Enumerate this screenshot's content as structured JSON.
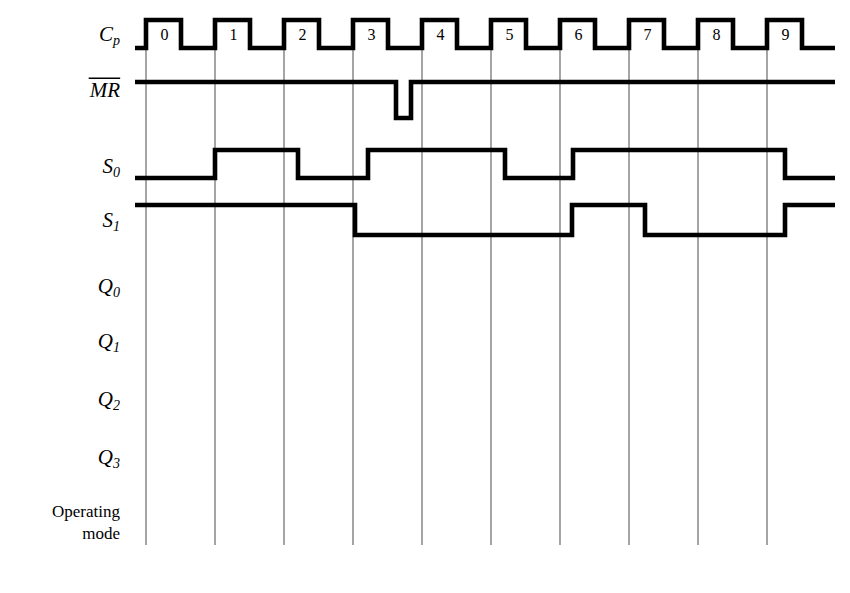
{
  "diagram": {
    "background_color": "#ffffff",
    "line_color": "#000000",
    "grid_color": "#5a5a5a"
  },
  "signals": [
    {
      "id": "cp",
      "label": "C",
      "subscript": "p",
      "overline": false,
      "style": "italic"
    },
    {
      "id": "mr",
      "label": "MR",
      "subscript": "",
      "overline": true,
      "style": "italic"
    },
    {
      "id": "s0",
      "label": "S",
      "subscript": "0",
      "overline": false,
      "style": "italic"
    },
    {
      "id": "s1",
      "label": "S",
      "subscript": "1",
      "overline": false,
      "style": "italic"
    },
    {
      "id": "q0",
      "label": "Q",
      "subscript": "0",
      "overline": false,
      "style": "italic"
    },
    {
      "id": "q1",
      "label": "Q",
      "subscript": "1",
      "overline": false,
      "style": "italic"
    },
    {
      "id": "q2",
      "label": "Q",
      "subscript": "2",
      "overline": false,
      "style": "italic"
    },
    {
      "id": "q3",
      "label": "Q",
      "subscript": "3",
      "overline": false,
      "style": "italic"
    }
  ],
  "bottom_label": {
    "line1": "Operating",
    "line2": "mode"
  },
  "clock": {
    "cycle_labels": [
      "0",
      "1",
      "2",
      "3",
      "4",
      "5",
      "6",
      "7",
      "8",
      "9"
    ],
    "pulse_count": 10
  },
  "chart_data": {
    "type": "line",
    "xlabel": "",
    "ylabel": "",
    "grid": true,
    "x_axis": {
      "unit": "clock cycle",
      "gridline_positions_px": [
        146,
        215,
        284,
        353,
        422,
        491,
        560,
        629,
        698,
        767
      ],
      "plot_left_px": 135,
      "plot_right_px": 835,
      "cycle_width_px": 69
    },
    "series": [
      {
        "name": "Cp",
        "description": "Free running clock, ten pulses numbered 0 through 9",
        "levels": [
          "low",
          "high"
        ],
        "high_y_px": 20,
        "low_y_px": 48,
        "pulses": [
          {
            "label": "0",
            "rise_px": 146,
            "fall_px": 181
          },
          {
            "label": "1",
            "rise_px": 215,
            "fall_px": 250
          },
          {
            "label": "2",
            "rise_px": 284,
            "fall_px": 319
          },
          {
            "label": "3",
            "rise_px": 353,
            "fall_px": 388
          },
          {
            "label": "4",
            "rise_px": 422,
            "fall_px": 457
          },
          {
            "label": "5",
            "rise_px": 491,
            "fall_px": 526
          },
          {
            "label": "6",
            "rise_px": 560,
            "fall_px": 595
          },
          {
            "label": "7",
            "rise_px": 629,
            "fall_px": 664
          },
          {
            "label": "8",
            "rise_px": 698,
            "fall_px": 733
          },
          {
            "label": "9",
            "rise_px": 767,
            "fall_px": 802
          }
        ]
      },
      {
        "name": "MR",
        "description": "Active low master reset, held high with one narrow low pulse during cycle 3",
        "high_y_px": 82,
        "low_y_px": 118,
        "transitions": [
          {
            "x_px": 135,
            "level": "high"
          },
          {
            "x_px": 396,
            "level": "low"
          },
          {
            "x_px": 411,
            "level": "high"
          },
          {
            "x_px": 835,
            "level": "high"
          }
        ]
      },
      {
        "name": "S0",
        "description": "Mode select bit 0",
        "high_y_px": 150,
        "low_y_px": 178,
        "transitions": [
          {
            "x_px": 135,
            "level": "low"
          },
          {
            "x_px": 215,
            "level": "high"
          },
          {
            "x_px": 298,
            "level": "low"
          },
          {
            "x_px": 368,
            "level": "high"
          },
          {
            "x_px": 505,
            "level": "low"
          },
          {
            "x_px": 573,
            "level": "high"
          },
          {
            "x_px": 785,
            "level": "low"
          },
          {
            "x_px": 835,
            "level": "low"
          }
        ]
      },
      {
        "name": "S1",
        "description": "Mode select bit 1",
        "high_y_px": 205,
        "low_y_px": 235,
        "transitions": [
          {
            "x_px": 135,
            "level": "high"
          },
          {
            "x_px": 355,
            "level": "low"
          },
          {
            "x_px": 572,
            "level": "high"
          },
          {
            "x_px": 645,
            "level": "low"
          },
          {
            "x_px": 785,
            "level": "high"
          },
          {
            "x_px": 835,
            "level": "high"
          }
        ]
      },
      {
        "name": "Q0",
        "description": "Output bit 0, waveform blank",
        "transitions": []
      },
      {
        "name": "Q1",
        "description": "Output bit 1, waveform blank",
        "transitions": []
      },
      {
        "name": "Q2",
        "description": "Output bit 2, waveform blank",
        "transitions": []
      },
      {
        "name": "Q3",
        "description": "Output bit 3, waveform blank",
        "transitions": []
      }
    ],
    "row_label_y_px": {
      "cp": 36,
      "mr": 92,
      "s0": 168,
      "s1": 222,
      "q0": 288,
      "q1": 343,
      "q2": 401,
      "q3": 459,
      "operating": 513,
      "mode": 535
    }
  }
}
